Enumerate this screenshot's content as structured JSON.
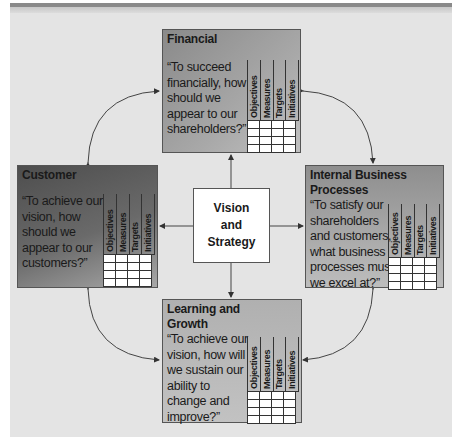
{
  "center": {
    "label_line1": "Vision",
    "label_line2": "and",
    "label_line3": "Strategy"
  },
  "grid_headers": [
    "Objectives",
    "Measures",
    "Targets",
    "Initiatives"
  ],
  "perspectives": {
    "financial": {
      "title": "Financial",
      "quote": [
        "“To succeed",
        "financially, how",
        "should we",
        "appear to our",
        "shareholders?”"
      ]
    },
    "customer": {
      "title": "Customer",
      "quote": [
        "“To achieve our",
        "vision, how",
        "should we",
        "appear to our",
        "customers?”"
      ]
    },
    "internal": {
      "title_line1": "Internal Business",
      "title_line2": "Processes",
      "quote": [
        "“To satisfy our",
        "shareholders",
        "and customers,",
        "what business",
        "processes must",
        "we excel at?”"
      ]
    },
    "learning": {
      "title_line1": "Learning and",
      "title_line2": "Growth",
      "quote": [
        "“To achieve our",
        "vision, how will",
        "we sustain our",
        "ability to",
        "change and",
        "improve?”"
      ]
    }
  },
  "colors": {
    "panel": "#e4e4e4",
    "box_light": "#b8b8b8",
    "box_dark": "#6e6e6e",
    "line": "#444444"
  }
}
